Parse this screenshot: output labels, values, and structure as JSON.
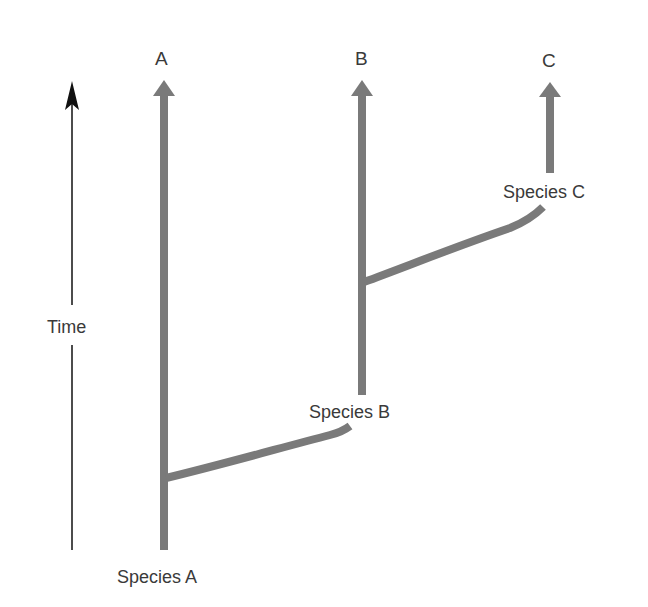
{
  "diagram": {
    "type": "phylogenetic-branching",
    "colors": {
      "branch": "#7a7a7a",
      "time_axis": "#111111",
      "text": "#3a3a3a"
    },
    "time_axis": {
      "label": "Time"
    },
    "lineages": [
      {
        "id": "A",
        "top_label": "A",
        "origin_label": "Species A"
      },
      {
        "id": "B",
        "top_label": "B",
        "origin_label": "Species B"
      },
      {
        "id": "C",
        "top_label": "C",
        "origin_label": "Species C"
      }
    ]
  }
}
